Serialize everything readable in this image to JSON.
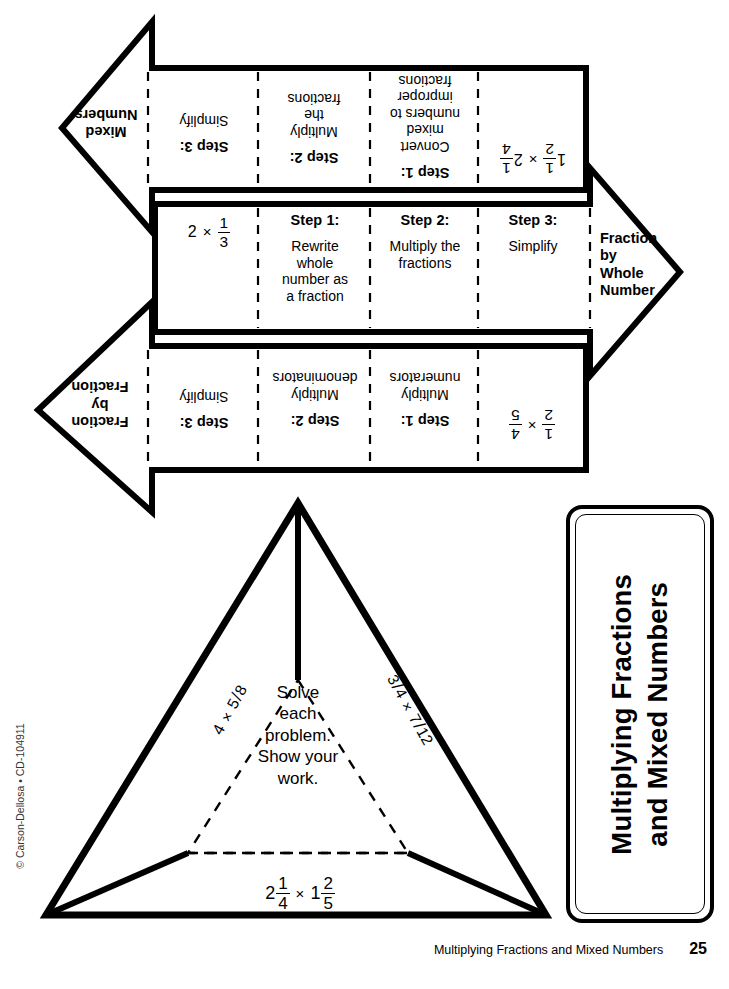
{
  "worksheet": {
    "title_line1": "Multiplying Fractions",
    "title_line2": "and Mixed Numbers",
    "footer_title": "Multiplying Fractions and Mixed Numbers",
    "page_number": "25",
    "copyright": "© Carson-Dellosa • CD-104911"
  },
  "arrows": [
    {
      "id": "mixed-numbers",
      "label": "Mixed Numbers",
      "label_lines": [
        "Mixed",
        "Numbers"
      ],
      "direction": "left",
      "rotated": true,
      "problem": {
        "display": "1 1/2 x 2 1/4",
        "left": {
          "whole": "1",
          "num": "1",
          "den": "2"
        },
        "op": "×",
        "right": {
          "whole": "2",
          "num": "1",
          "den": "4"
        }
      },
      "steps": [
        {
          "title": "Step 1:",
          "body": "Convert mixed numbers to improper fractions",
          "body_lines": [
            "Convert",
            "mixed",
            "numbers to",
            "improper",
            "fractions"
          ]
        },
        {
          "title": "Step 2:",
          "body": "Multiply the fractions",
          "body_lines": [
            "Multiply",
            "the",
            "fractions"
          ]
        },
        {
          "title": "Step 3:",
          "body": "Simplify",
          "body_lines": [
            "Simplify"
          ]
        }
      ]
    },
    {
      "id": "fraction-by-whole-number",
      "label": "Fraction by Whole Number",
      "label_lines": [
        "Fraction",
        "by",
        "Whole",
        "Number"
      ],
      "direction": "right",
      "rotated": false,
      "problem": {
        "display": "2 x 1/3",
        "left": {
          "whole": "2"
        },
        "op": "×",
        "right": {
          "num": "1",
          "den": "3"
        }
      },
      "steps": [
        {
          "title": "Step 1:",
          "body": "Rewrite whole number as a fraction",
          "body_lines": [
            "Rewrite",
            "whole",
            "number as",
            "a fraction"
          ]
        },
        {
          "title": "Step 2:",
          "body": "Multiply the fractions",
          "body_lines": [
            "Multiply the",
            "fractions"
          ]
        },
        {
          "title": "Step 3:",
          "body": "Simplify",
          "body_lines": [
            "Simplify"
          ]
        }
      ]
    },
    {
      "id": "fraction-by-fraction",
      "label": "Fraction by Fraction",
      "label_lines": [
        "Fraction",
        "by",
        "Fraction"
      ],
      "direction": "left",
      "rotated": true,
      "problem": {
        "display": "1/2 x 4/5",
        "left": {
          "num": "1",
          "den": "2"
        },
        "op": "×",
        "right": {
          "num": "4",
          "den": "5"
        }
      },
      "steps": [
        {
          "title": "Step 1:",
          "body": "Multiply numerators",
          "body_lines": [
            "Multiply",
            "numerators"
          ]
        },
        {
          "title": "Step 2:",
          "body": "Multiply denominators",
          "body_lines": [
            "Multiply",
            "denominators"
          ]
        },
        {
          "title": "Step 3:",
          "body": "Simplify",
          "body_lines": [
            "Simplify"
          ]
        }
      ]
    }
  ],
  "triangle": {
    "instruction": "Solve each problem. Show your work.",
    "instruction_lines": [
      "Solve",
      "each",
      "problem.",
      "Show your",
      "work."
    ],
    "problems": {
      "left": {
        "display": "4 x 5/8",
        "whole": "4",
        "op": "×",
        "num": "5",
        "den": "8"
      },
      "right": {
        "display": "3/4 x 7/12",
        "num1": "3",
        "den1": "4",
        "op": "×",
        "num2": "7",
        "den2": "12"
      },
      "bottom": {
        "display": "2 1/4 x 1 2/5",
        "left": {
          "whole": "2",
          "num": "1",
          "den": "4"
        },
        "op": "×",
        "right": {
          "whole": "1",
          "num": "2",
          "den": "5"
        }
      }
    }
  }
}
